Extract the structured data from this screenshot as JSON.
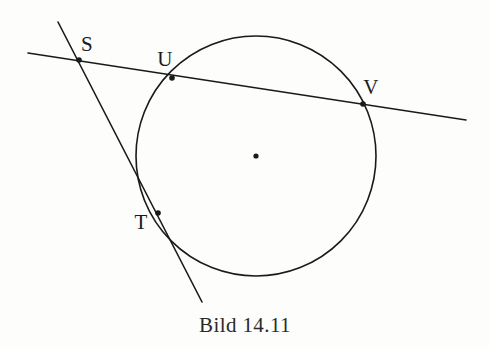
{
  "figure": {
    "caption": "Bild 14.11",
    "background_color": "#fdfdfc",
    "ink_color": "#1a1a1a",
    "labels": {
      "s": "S",
      "u": "U",
      "v": "V",
      "t": "T"
    }
  },
  "chart_data": {
    "type": "diagram",
    "title": "Bild 14.11",
    "canvas": {
      "width": 490,
      "height": 347
    },
    "circle": {
      "name": "circle",
      "center": {
        "x": 256,
        "y": 156
      },
      "radius": 120,
      "stroke": "#1a1a1a",
      "stroke_width": 1.6,
      "fill": "none"
    },
    "center_marker": {
      "name": "circle-center-dot",
      "x": 256,
      "y": 156,
      "radius": 2.6
    },
    "lines": [
      {
        "name": "secant-line",
        "label": "Sekante S-U-V",
        "x1": 28,
        "y1": 53,
        "x2": 466,
        "y2": 120,
        "stroke": "#1a1a1a",
        "stroke_width": 1.6
      },
      {
        "name": "tangent-line",
        "label": "Tangente S-T",
        "x1": 58,
        "y1": 22,
        "x2": 202,
        "y2": 302,
        "stroke": "#1a1a1a",
        "stroke_width": 1.6
      }
    ],
    "points": [
      {
        "id": "s",
        "label": "S",
        "x": 79,
        "y": 60,
        "label_x": 87,
        "label_y": 44,
        "role": "external-intersection-of-secant-and-tangent",
        "dot_radius": 2.8
      },
      {
        "id": "u",
        "label": "U",
        "x": 172,
        "y": 78,
        "label_x": 165,
        "label_y": 59,
        "role": "secant-entry-on-circle",
        "dot_radius": 2.8
      },
      {
        "id": "v",
        "label": "V",
        "x": 363,
        "y": 104,
        "label_x": 371,
        "label_y": 87,
        "role": "secant-exit-on-circle",
        "dot_radius": 2.8
      },
      {
        "id": "t",
        "label": "T",
        "x": 158,
        "y": 213,
        "label_x": 141,
        "label_y": 222,
        "role": "tangency-point-on-circle",
        "dot_radius": 2.8
      }
    ]
  }
}
